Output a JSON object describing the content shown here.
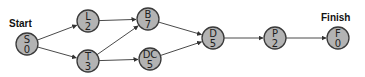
{
  "labels": {
    "start": "Start",
    "finish": "Finish"
  },
  "nodes": [
    {
      "id": "S",
      "name": "S",
      "duration": "0",
      "cx": 27,
      "cy": 44
    },
    {
      "id": "L",
      "name": "L",
      "duration": "2",
      "cx": 88,
      "cy": 21
    },
    {
      "id": "T",
      "name": "T",
      "duration": "3",
      "cx": 88,
      "cy": 61
    },
    {
      "id": "B",
      "name": "B",
      "duration": "7",
      "cx": 148,
      "cy": 19
    },
    {
      "id": "DC",
      "name": "DC",
      "duration": "5",
      "cx": 150,
      "cy": 59
    },
    {
      "id": "D",
      "name": "D",
      "duration": "5",
      "cx": 213,
      "cy": 38
    },
    {
      "id": "P",
      "name": "P",
      "duration": "2",
      "cx": 275,
      "cy": 38
    },
    {
      "id": "F",
      "name": "F",
      "duration": "0",
      "cx": 338,
      "cy": 38
    }
  ],
  "edges": [
    {
      "from": "S",
      "to": "L"
    },
    {
      "from": "S",
      "to": "T"
    },
    {
      "from": "L",
      "to": "B"
    },
    {
      "from": "T",
      "to": "B"
    },
    {
      "from": "T",
      "to": "DC"
    },
    {
      "from": "B",
      "to": "D"
    },
    {
      "from": "DC",
      "to": "D"
    },
    {
      "from": "D",
      "to": "P"
    },
    {
      "from": "P",
      "to": "F"
    }
  ],
  "colors": {
    "node_fill": "#b3b3b3",
    "node_stroke": "#3a3a3a",
    "edge": "#4a4a4a",
    "text": "#1e1e1e"
  }
}
